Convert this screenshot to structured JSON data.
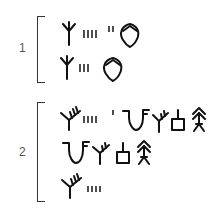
{
  "figure": {
    "groups": [
      {
        "number": "1",
        "lines": [
          {
            "signs": [
              "tree-sign",
              "tally-4",
              "tally-2",
              "vessel-sign"
            ]
          },
          {
            "signs": [
              "tree-sign",
              "tally-3",
              "vessel-sign"
            ]
          }
        ]
      },
      {
        "number": "2",
        "lines": [
          {
            "signs": [
              "branched-tree-sign",
              "tally-4",
              "tally-1",
              "v-hook-sign",
              "tree-sign",
              "box-stem-sign",
              "fir-sign"
            ]
          },
          {
            "signs": [
              "v-hook-sign",
              "tree-sign",
              "box-stem-sign",
              "fir-sign"
            ]
          },
          {
            "signs": [
              "branched-tree-sign",
              "tally-4"
            ]
          }
        ]
      }
    ],
    "colors": {
      "ink": "#111111",
      "bracket": "#333333",
      "label": "#555555",
      "background": "#ffffff"
    }
  }
}
